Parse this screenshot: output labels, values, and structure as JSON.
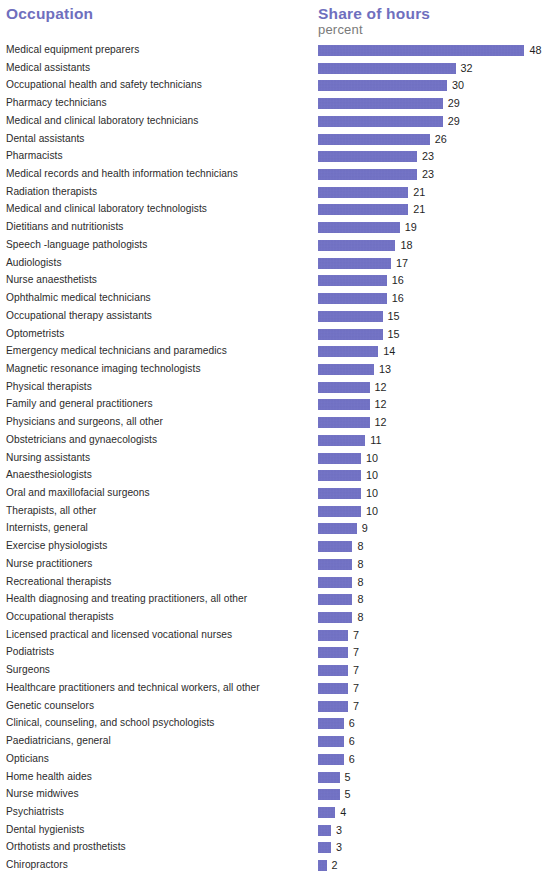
{
  "header": {
    "occupation_label": "Occupation",
    "share_label": "Share of hours",
    "share_unit_label": "percent"
  },
  "colors": {
    "accent": "#6f6fbe",
    "bar": "#6b6bc4",
    "label_text": "#2b2b2b",
    "unit_text": "#7a7a7a",
    "background": "#ffffff"
  },
  "chart_data": {
    "type": "bar",
    "orientation": "horizontal",
    "title": "",
    "xlabel": "Share of hours, percent",
    "ylabel": "Occupation",
    "grid": false,
    "legend": null,
    "xlim": [
      0,
      48
    ],
    "pixels_per_unit": 4.3,
    "bar_origin_x": 318,
    "note": "First bar value label is clipped at the right edge of the image",
    "categories": [
      "Medical equipment preparers",
      "Medical assistants",
      "Occupational health and safety technicians",
      "Pharmacy technicians",
      "Medical and clinical laboratory technicians",
      "Dental assistants",
      "Pharmacists",
      "Medical records and health information technicians",
      "Radiation therapists",
      "Medical and clinical laboratory technologists",
      "Dietitians and nutritionists",
      "Speech -language pathologists",
      "Audiologists",
      "Nurse anaesthetists",
      "Ophthalmic medical technicians",
      "Occupational therapy assistants",
      "Optometrists",
      "Emergency medical technicians and paramedics",
      "Magnetic resonance imaging technologists",
      "Physical therapists",
      "Family and general practitioners",
      "Physicians and surgeons, all other",
      "Obstetricians and gynaecologists",
      "Nursing assistants",
      "Anaesthesiologists",
      "Oral and maxillofacial surgeons",
      "Therapists, all other",
      "Internists, general",
      "Exercise physiologists",
      "Nurse practitioners",
      "Recreational therapists",
      "Health diagnosing and treating practitioners, all other",
      "Occupational therapists",
      "Licensed practical and licensed vocational nurses",
      "Podiatrists",
      "Surgeons",
      "Healthcare practitioners and technical workers, all other",
      "Genetic counselors",
      "Clinical, counseling, and school psychologists",
      "Paediatricians, general",
      "Opticians",
      "Home health aides",
      "Nurse midwives",
      "Psychiatrists",
      "Dental hygienists",
      "Orthotists and prosthetists",
      "Chiropractors"
    ],
    "values": [
      48,
      32,
      30,
      29,
      29,
      26,
      23,
      23,
      21,
      21,
      19,
      18,
      17,
      16,
      16,
      15,
      15,
      14,
      13,
      12,
      12,
      12,
      11,
      10,
      10,
      10,
      10,
      9,
      8,
      8,
      8,
      8,
      8,
      7,
      7,
      7,
      7,
      7,
      6,
      6,
      6,
      5,
      5,
      4,
      3,
      3,
      2
    ],
    "value_labels": [
      "48",
      "32",
      "30",
      "29",
      "29",
      "26",
      "23",
      "23",
      "21",
      "21",
      "19",
      "18",
      "17",
      "16",
      "16",
      "15",
      "15",
      "14",
      "13",
      "12",
      "12",
      "12",
      "11",
      "10",
      "10",
      "10",
      "10",
      "9",
      "8",
      "8",
      "8",
      "8",
      "8",
      "7",
      "7",
      "7",
      "7",
      "7",
      "6",
      "6",
      "6",
      "5",
      "5",
      "4",
      "3",
      "3",
      "2"
    ]
  }
}
